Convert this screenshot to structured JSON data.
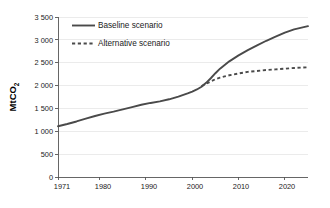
{
  "chart_data": {
    "type": "line",
    "title": "",
    "xlabel": "",
    "ylabel": "MtCO",
    "ylabel_subscript": "2",
    "xlim": [
      1971,
      2025
    ],
    "ylim": [
      0,
      3500
    ],
    "grid": true,
    "legend_position": "top-left-inside",
    "y_ticks": [
      0,
      500,
      1000,
      1500,
      2000,
      2500,
      3000,
      3500
    ],
    "y_tick_labels": [
      "0",
      "500",
      "1 000",
      "1 500",
      "2 000",
      "2 500",
      "3 000",
      "3 500"
    ],
    "x_ticks": [
      1971,
      1980,
      1990,
      2000,
      2010,
      2020
    ],
    "x_tick_labels": [
      "1971",
      "1980",
      "1990",
      "2000",
      "2010",
      "2020"
    ],
    "series": [
      {
        "name": "Baseline scenario",
        "style": "solid",
        "color": "#4a4a4a",
        "x": [
          1971,
          1973,
          1975,
          1977,
          1979,
          1981,
          1983,
          1985,
          1987,
          1989,
          1991,
          1993,
          1995,
          1997,
          1999,
          2000,
          2001,
          2002,
          2003,
          2004,
          2005,
          2006,
          2007,
          2008,
          2010,
          2012,
          2014,
          2016,
          2018,
          2020,
          2022,
          2025
        ],
        "y": [
          1110,
          1160,
          1215,
          1275,
          1335,
          1385,
          1430,
          1480,
          1530,
          1580,
          1620,
          1655,
          1700,
          1760,
          1830,
          1870,
          1915,
          1975,
          2060,
          2160,
          2270,
          2370,
          2450,
          2530,
          2660,
          2775,
          2880,
          2980,
          3070,
          3160,
          3230,
          3300
        ]
      },
      {
        "name": "Alternative scenario",
        "style": "dashed",
        "color": "#4a4a4a",
        "x": [
          2002,
          2003,
          2004,
          2005,
          2006,
          2007,
          2008,
          2010,
          2012,
          2014,
          2016,
          2018,
          2020,
          2022,
          2025
        ],
        "y": [
          1990,
          2040,
          2090,
          2140,
          2175,
          2200,
          2225,
          2265,
          2300,
          2320,
          2340,
          2355,
          2370,
          2385,
          2400
        ]
      }
    ],
    "legend": [
      {
        "label": "Baseline scenario",
        "style": "solid"
      },
      {
        "label": "Alternative scenario",
        "style": "dashed"
      }
    ]
  }
}
